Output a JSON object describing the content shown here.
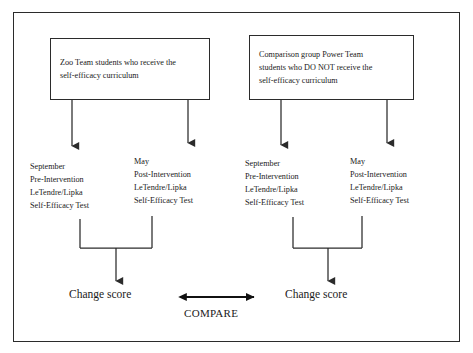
{
  "diagram": {
    "conditions": [
      {
        "id": "treatment",
        "lines": [
          "Zoo Team students who receive the",
          "self-efficacy curriculum"
        ]
      },
      {
        "id": "comparison",
        "lines": [
          "Comparison group Power Team",
          "students who DO NOT receive the",
          "self-efficacy curriculum"
        ]
      }
    ],
    "measures": [
      {
        "id": "treatment-pre",
        "lines": [
          "September",
          "Pre-Intervention",
          "LeTendre/Lipka",
          "Self-Efficacy Test"
        ]
      },
      {
        "id": "treatment-post",
        "lines": [
          "May",
          "Post-Intervention",
          "LeTendre/Lipka",
          "Self-Efficacy Test"
        ]
      },
      {
        "id": "comparison-pre",
        "lines": [
          "September",
          "Pre-Intervention",
          "LeTendre/Lipka",
          "Self-Efficacy Test"
        ]
      },
      {
        "id": "comparison-post",
        "lines": [
          "May",
          "Post-Intervention",
          "LeTendre/Lipka",
          "Self-Efficacy Test"
        ]
      }
    ],
    "outcomes": [
      {
        "id": "treatment-change",
        "label": "Change score"
      },
      {
        "id": "comparison-change",
        "label": "Change score"
      }
    ],
    "compare_label": "COMPARE",
    "colors": {
      "line": "#2b2b2b",
      "text": "#1a1a1a",
      "background": "#ffffff"
    }
  }
}
